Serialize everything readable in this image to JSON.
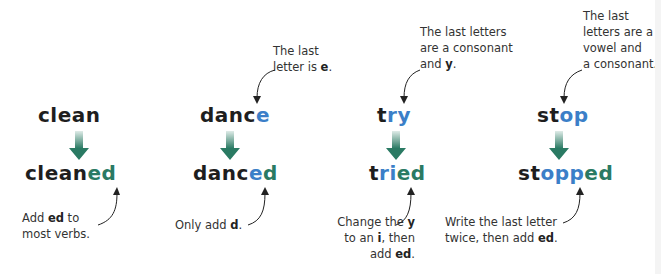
{
  "colors": {
    "blue": "#3b7fc8",
    "green": "#2a7a63",
    "arrow": "#2a7a63",
    "text": "#1e1e1e"
  },
  "columns": [
    {
      "base": [
        {
          "t": "clean",
          "c": ""
        }
      ],
      "result": [
        {
          "t": "clean",
          "c": ""
        },
        {
          "t": "ed",
          "c": "green"
        }
      ],
      "top_note": [],
      "bottom_note": [
        "Add |ed| to",
        "most verbs."
      ]
    },
    {
      "base": [
        {
          "t": "danc",
          "c": ""
        },
        {
          "t": "e",
          "c": "blue"
        }
      ],
      "result": [
        {
          "t": "danc",
          "c": ""
        },
        {
          "t": "e",
          "c": "blue"
        },
        {
          "t": "d",
          "c": "green"
        }
      ],
      "top_note": [
        "The last",
        "letter is |e|."
      ],
      "bottom_note": [
        "Only add |d|."
      ]
    },
    {
      "base": [
        {
          "t": "t",
          "c": ""
        },
        {
          "t": "ry",
          "c": "blue"
        }
      ],
      "result": [
        {
          "t": "t",
          "c": ""
        },
        {
          "t": "ri",
          "c": "blue"
        },
        {
          "t": "ed",
          "c": "green"
        }
      ],
      "top_note": [
        "The last letters",
        "are a consonant",
        "and |y|."
      ],
      "bottom_note": [
        "Change the |y|",
        "to an |i|, then",
        "add |ed|."
      ]
    },
    {
      "base": [
        {
          "t": "st",
          "c": ""
        },
        {
          "t": "op",
          "c": "blue"
        }
      ],
      "result": [
        {
          "t": "st",
          "c": ""
        },
        {
          "t": "opp",
          "c": "blue"
        },
        {
          "t": "ed",
          "c": "green"
        }
      ],
      "top_note": [
        "The last",
        "letters are a",
        "vowel and",
        "a consonant."
      ],
      "bottom_note": [
        "Write the last letter",
        "twice, then add |ed|."
      ]
    }
  ]
}
